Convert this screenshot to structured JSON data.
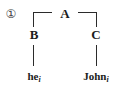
{
  "figure": {
    "example_number": "①"
  },
  "tree": {
    "root": {
      "label": "A"
    },
    "children": [
      {
        "label": "B",
        "terminal": {
          "word": "he",
          "index": "i"
        }
      },
      {
        "label": "C",
        "terminal": {
          "word": "John",
          "index": "i"
        }
      }
    ]
  },
  "colors": {
    "background": "#ffffff",
    "text": "#1c1c1c",
    "line": "#2b2b2b",
    "enumerator": "#454545"
  }
}
